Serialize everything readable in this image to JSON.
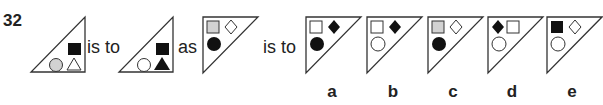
{
  "question": {
    "number": "32",
    "connectors": {
      "is_to_1": "is to",
      "as": "as",
      "is_to_2": "is to"
    }
  },
  "colors": {
    "black": "#111111",
    "gray": "#d2d2d2",
    "white": "#ffffff",
    "stroke": "#333333"
  },
  "figures": {
    "premise_a": {
      "orientation": "right-angle-bottom-right",
      "shapes": [
        "black square (top)",
        "gray circle (bottom-left)",
        "white triangle (bottom-right)"
      ]
    },
    "premise_b": {
      "orientation": "right-angle-bottom-right",
      "shapes": [
        "black square (top)",
        "white circle (bottom-left)",
        "black triangle (bottom-right)"
      ]
    },
    "query": {
      "orientation": "right-angle-top-left",
      "shapes": [
        "gray square (top-left)",
        "white diamond (top-right)",
        "black circle (bottom)"
      ]
    }
  },
  "options": [
    {
      "label": "a",
      "shapes": [
        "white square",
        "black diamond",
        "black circle"
      ]
    },
    {
      "label": "b",
      "shapes": [
        "white square",
        "black diamond",
        "white circle"
      ]
    },
    {
      "label": "c",
      "shapes": [
        "gray square",
        "white diamond",
        "black circle"
      ]
    },
    {
      "label": "d",
      "shapes": [
        "black diamond",
        "white square",
        "white circle"
      ]
    },
    {
      "label": "e",
      "shapes": [
        "black square",
        "white diamond",
        "white circle"
      ]
    }
  ]
}
